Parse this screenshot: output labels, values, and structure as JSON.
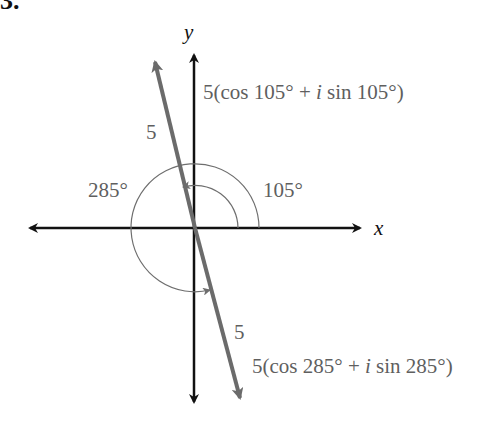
{
  "problem_number": "3.",
  "axes": {
    "x_label": "x",
    "y_label": "y"
  },
  "vectors": [
    {
      "name": "upper",
      "magnitude_label": "5",
      "angle_deg": 105,
      "expression": {
        "prefix": "5(cos 105° + ",
        "imag": "i",
        "suffix": " sin 105°)"
      }
    },
    {
      "name": "lower",
      "magnitude_label": "5",
      "angle_deg": 285,
      "expression": {
        "prefix": "5(cos 285° + ",
        "imag": "i",
        "suffix": " sin 285°)"
      }
    }
  ],
  "angle_labels": {
    "inner": "105°",
    "outer": "285°"
  },
  "colors": {
    "axis": "#111111",
    "vector": "#6b6b6b",
    "arc": "#6e6e6e",
    "text": "#5f5f5f"
  }
}
